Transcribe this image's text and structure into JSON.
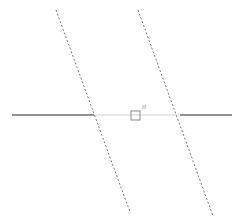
{
  "figure": {
    "canvas": {
      "width": 244,
      "height": 219,
      "background": "#ffffff"
    },
    "colors": {
      "dashed_line": "#7a7a87",
      "solid_line_dark": "#6e6e6e",
      "solid_line_light": "#c9c9c9",
      "marker_stroke": "#8a8a8a",
      "label_text": "#9a9a9a"
    },
    "elements": {
      "dashed_line_left": {
        "name": "left-dashed-line",
        "style": "dashed",
        "x1": 56,
        "y1": 10,
        "x2": 130,
        "y2": 212,
        "color": "#7a7a87",
        "width": 1,
        "dash": "2 2"
      },
      "dashed_line_right": {
        "name": "right-dashed-line",
        "style": "dashed",
        "x1": 138,
        "y1": 10,
        "x2": 213,
        "y2": 216,
        "color": "#7a7a87",
        "width": 1,
        "dash": "2 2"
      },
      "horizontal_left_segment": {
        "name": "horizontal-line-left-segment",
        "style": "solid",
        "x1": 12,
        "y1": 115,
        "x2": 94,
        "y2": 115,
        "color": "#6e6e6e",
        "width": 1.4
      },
      "horizontal_middle_segment": {
        "name": "horizontal-line-middle-segment",
        "style": "solid",
        "x1": 94,
        "y1": 115,
        "x2": 180,
        "y2": 115,
        "color": "#c9c9c9",
        "width": 0.8
      },
      "horizontal_right_segment": {
        "name": "horizontal-line-right-segment",
        "style": "solid",
        "x1": 180,
        "y1": 115,
        "x2": 232,
        "y2": 115,
        "color": "#6e6e6e",
        "width": 1.4
      },
      "square_marker": {
        "name": "square-point-marker",
        "shape": "hollow-square",
        "x": 131,
        "y": 111,
        "size": 9,
        "stroke": "#8a8a8a",
        "fill": "none"
      },
      "marker_label": {
        "name": "marker-label",
        "text": "M",
        "x": 142,
        "y": 109,
        "color": "#9a9a9a"
      },
      "intersection_left": {
        "name": "left-intersection-point",
        "x": 94,
        "y": 115
      },
      "intersection_right": {
        "name": "right-intersection-point",
        "x": 180,
        "y": 115
      }
    }
  }
}
